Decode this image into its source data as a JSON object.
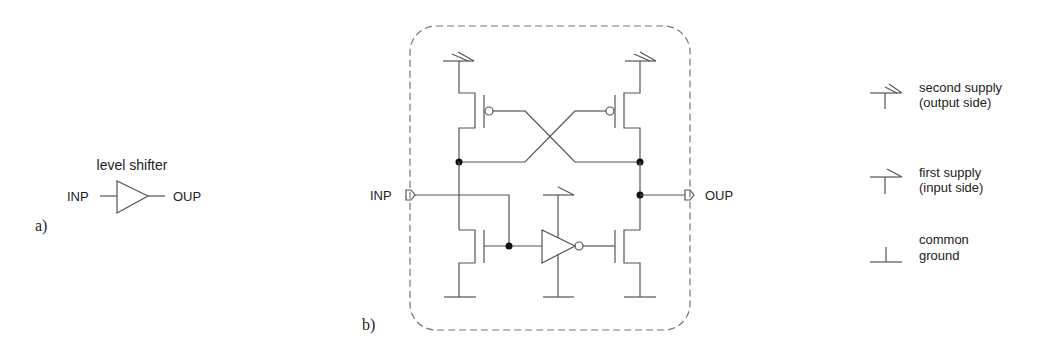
{
  "part_a": {
    "panel_label": "a)",
    "title": "level shifter",
    "input_label": "INP",
    "output_label": "OUP",
    "symbol": "buffer-triangle"
  },
  "part_b": {
    "panel_label": "b)",
    "input_label": "INP",
    "output_label": "OUP",
    "components": [
      "pmos-left (second supply)",
      "pmos-right (second supply)",
      "nmos-left (common ground)",
      "inverter (first supply / common ground)",
      "nmos-right (common ground)"
    ],
    "border_style": "dashed-rounded"
  },
  "legend": {
    "items": [
      {
        "icon": "second-supply-icon",
        "line1": "second supply",
        "line2": "(output side)"
      },
      {
        "icon": "first-supply-icon",
        "line1": "first supply",
        "line2": "(input side)"
      },
      {
        "icon": "ground-icon",
        "line1": "common",
        "line2": "ground"
      }
    ]
  }
}
